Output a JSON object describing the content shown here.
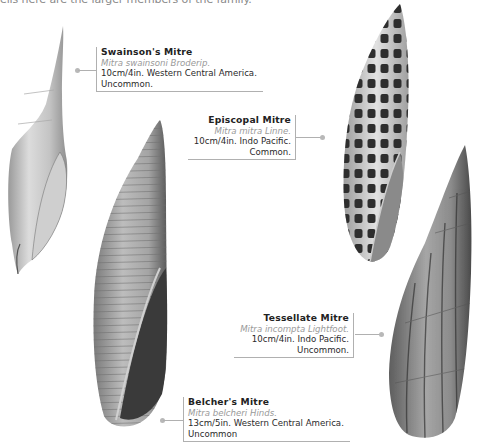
{
  "intro_text": "ells here are the larger members of the family.",
  "shells": [
    {
      "id": "swainsons",
      "name": "Swainson's Mitre",
      "scientific": "Mitra swainsoni Broderip.",
      "desc_line1": "10cm/4in. Western Central America.",
      "desc_line2": "Uncommon.",
      "pattern": "pale-smooth"
    },
    {
      "id": "episcopal",
      "name": "Episcopal Mitre",
      "scientific": "Mitra mitra Linne.",
      "desc_line1": "10cm/4in. Indo Pacific.",
      "desc_line2": "Common.",
      "pattern": "checkered-spots"
    },
    {
      "id": "tessellate",
      "name": "Tessellate Mitre",
      "scientific": "Mitra incompta Lightfoot.",
      "desc_line1": "10cm/4in. Indo Pacific.",
      "desc_line2": "Uncommon.",
      "pattern": "ribbed-streaked"
    },
    {
      "id": "belchers",
      "name": "Belcher's Mitre",
      "scientific": "Mitra belcheri Hinds.",
      "desc_line1": "13cm/5in. Western Central America.",
      "desc_line2": "Uncommon",
      "pattern": "spiral-ridged"
    }
  ]
}
